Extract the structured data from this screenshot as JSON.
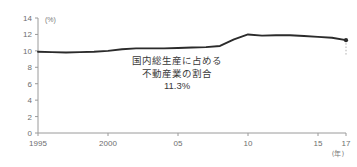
{
  "chart_data": {
    "type": "line",
    "title": "",
    "subtitle": "",
    "xlabel": "(年)",
    "ylabel": "(%)",
    "xlim": [
      1995,
      2017
    ],
    "ylim": [
      0,
      14
    ],
    "grid": false,
    "legend": "none",
    "y_ticks": [
      "0",
      "2",
      "4",
      "6",
      "8",
      "10",
      "12",
      "14"
    ],
    "y_tick_values": [
      0,
      2,
      4,
      6,
      8,
      10,
      12,
      14
    ],
    "x_ticks": [
      "1995",
      "2000",
      "05",
      "10",
      "15",
      "17"
    ],
    "x_tick_values": [
      1995,
      2000,
      2005,
      2010,
      2015,
      2017
    ],
    "series": [
      {
        "name": "国内総生産に占める不動産業の割合",
        "x": [
          1995,
          1996,
          1997,
          1998,
          1999,
          2000,
          2001,
          2002,
          2003,
          2004,
          2005,
          2006,
          2007,
          2008,
          2009,
          2010,
          2011,
          2012,
          2013,
          2014,
          2015,
          2016,
          2017
        ],
        "values": [
          9.9,
          9.85,
          9.8,
          9.85,
          9.9,
          10.0,
          10.2,
          10.3,
          10.3,
          10.3,
          10.35,
          10.4,
          10.45,
          10.6,
          11.4,
          12.0,
          11.85,
          11.9,
          11.9,
          11.8,
          11.7,
          11.6,
          11.3
        ]
      }
    ],
    "annotation": {
      "line1": "国内総生産に占める",
      "line2": "不動産業の割合",
      "value": "11.3%",
      "points_to_x": 2017,
      "points_to_y": 11.3
    },
    "end_marker": {
      "x": 2017,
      "y": 11.3
    }
  }
}
